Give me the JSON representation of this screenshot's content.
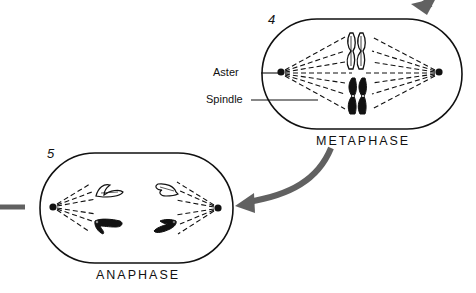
{
  "diagram": {
    "colors": {
      "outline": "#111111",
      "arrow": "#616161",
      "background": "#ffffff"
    },
    "stages": [
      {
        "number": "4",
        "name": "METAPHASE",
        "labels": [
          {
            "text": "Aster",
            "points_to": "left-aster"
          },
          {
            "text": "Spindle",
            "points_to": "spindle-fibers"
          }
        ],
        "chromosomes": {
          "upper_pair": "white",
          "lower_pair": "black"
        }
      },
      {
        "number": "5",
        "name": "ANAPHASE",
        "chromosomes": {
          "left_group": [
            "white",
            "black"
          ],
          "right_group": [
            "white",
            "black"
          ]
        }
      }
    ],
    "arrows": [
      {
        "id": "incoming-top-right",
        "description": "arrow entering metaphase from top right"
      },
      {
        "id": "metaphase-to-anaphase",
        "description": "curved arrow from metaphase to anaphase"
      },
      {
        "id": "outgoing-left",
        "description": "line leaving anaphase to the left"
      }
    ]
  }
}
